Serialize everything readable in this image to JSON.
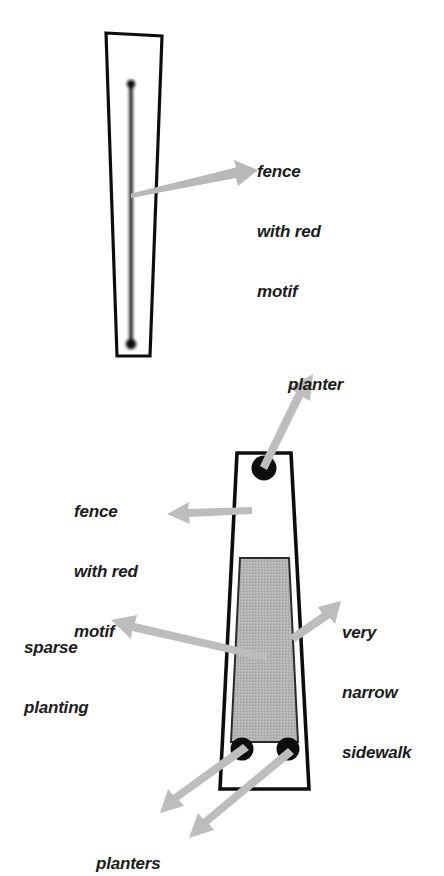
{
  "figure": {
    "background_color": "#ffffff",
    "ink_color": "#111111",
    "arrow_color": "#b3b3b3",
    "planting_fill": "#b0b0b0",
    "planter_color": "#111111"
  },
  "annotations": [
    {
      "id": "fence-red-motif-top",
      "lines": [
        "fence",
        "with red",
        "motif"
      ],
      "text": "fence with red motif",
      "position": {
        "x": 257,
        "y": 124
      },
      "align": "left"
    },
    {
      "id": "planter-single",
      "lines": [
        "planter"
      ],
      "text": "planter",
      "position": {
        "x": 288,
        "y": 337
      },
      "align": "left"
    },
    {
      "id": "fence-red-motif-bottom",
      "lines": [
        "fence",
        "with red",
        "motif"
      ],
      "text": "fence with red motif",
      "position": {
        "x": 74,
        "y": 464
      },
      "align": "left"
    },
    {
      "id": "very-narrow-sidewalk",
      "lines": [
        "very",
        "narrow",
        "sidewalk"
      ],
      "text": "very narrow sidewalk",
      "position": {
        "x": 342,
        "y": 585
      },
      "align": "left"
    },
    {
      "id": "sparse-planting",
      "lines": [
        "sparse",
        "planting"
      ],
      "text": "sparse planting",
      "position": {
        "x": 24,
        "y": 600
      },
      "align": "left"
    },
    {
      "id": "planters-pair",
      "lines": [
        "planters"
      ],
      "text": "planters",
      "position": {
        "x": 96,
        "y": 816
      },
      "align": "left"
    }
  ],
  "shapes": {
    "upper_block": {
      "name": "upper-sidewalk-outline",
      "points": "106,33 162,36 150,356 117,356"
    },
    "upper_fence": {
      "name": "upper-fence-line",
      "x1": 131,
      "y1": 82,
      "x2": 131,
      "y2": 340,
      "stroke_width": 4
    },
    "upper_fence_cap_top": {
      "cx": 131,
      "cy": 84,
      "r": 4
    },
    "upper_fence_cap_bottom": {
      "cx": 131,
      "cy": 344,
      "r": 5
    },
    "lower_block": {
      "name": "lower-sidewalk-outline",
      "points": "237,453 291,453 308,789 220,789"
    },
    "lower_planting": {
      "name": "sparse-planting-area",
      "points": "240,557 289,557 298,742 232,742"
    },
    "lower_fence": {
      "name": "lower-fence-line",
      "x1": 248,
      "y1": 481,
      "x2": 248,
      "y2": 541,
      "stroke_width": 5
    },
    "planters": [
      {
        "name": "planter-top",
        "cx": 264,
        "cy": 468,
        "r": 12
      },
      {
        "name": "planter-bottom-left",
        "cx": 242,
        "cy": 749,
        "r": 11
      },
      {
        "name": "planter-bottom-right",
        "cx": 288,
        "cy": 749,
        "r": 11
      }
    ]
  },
  "arrows": [
    {
      "id": "arrow-fence-top",
      "from": {
        "x": 131,
        "y": 192
      },
      "to": {
        "x": 252,
        "y": 162
      },
      "target": "fence-red-motif-top"
    },
    {
      "id": "arrow-planter-single",
      "from": {
        "x": 262,
        "y": 463
      },
      "to": {
        "x": 305,
        "y": 372
      },
      "target": "planter-single"
    },
    {
      "id": "arrow-fence-bottom",
      "from": {
        "x": 250,
        "y": 513
      },
      "to": {
        "x": 173,
        "y": 513
      },
      "target": "fence-red-motif-bottom"
    },
    {
      "id": "arrow-very-narrow-sidewalk",
      "from": {
        "x": 293,
        "y": 630
      },
      "to": {
        "x": 335,
        "y": 598
      },
      "target": "very-narrow-sidewalk"
    },
    {
      "id": "arrow-sparse-planting",
      "from": {
        "x": 265,
        "y": 654
      },
      "to": {
        "x": 117,
        "y": 617
      },
      "target": "sparse-planting"
    },
    {
      "id": "arrow-planters-left",
      "from": {
        "x": 238,
        "y": 750
      },
      "to": {
        "x": 155,
        "y": 806
      },
      "target": "planters-pair"
    },
    {
      "id": "arrow-planters-right",
      "from": {
        "x": 285,
        "y": 752
      },
      "to": {
        "x": 185,
        "y": 830
      },
      "target": "planters-pair"
    }
  ]
}
